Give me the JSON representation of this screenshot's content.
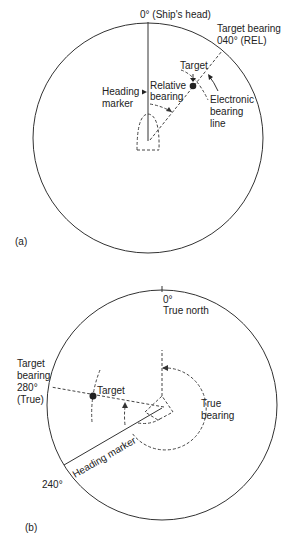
{
  "figure": {
    "colors": {
      "ink": "#333333",
      "background": "#ffffff"
    },
    "panel_a": {
      "label": "(a)",
      "mode": "relative bearing (ship's head up)",
      "labels": {
        "ships_head": "0° (Ship's head)",
        "target_bearing_line1": "Target bearing",
        "target_bearing_line2": "040° (REL)",
        "target": "Target",
        "relative_bearing_line1": "Relative",
        "relative_bearing_line2": "bearing",
        "heading_marker_line1": "Heading",
        "heading_marker_line2": "marker",
        "ebl_line1": "Electronic",
        "ebl_line2": "bearing",
        "ebl_line3": "line"
      },
      "bearing_deg": 40
    },
    "panel_b": {
      "label": "(b)",
      "mode": "true bearing (north up)",
      "labels": {
        "north_deg": "0°",
        "true_north": "True north",
        "target_bearing_line1": "Target",
        "target_bearing_line2": "bearing",
        "target_bearing_line3": "280°",
        "target_bearing_line4": "(True)",
        "target": "Target",
        "true_bearing_line1": "True",
        "true_bearing_line2": "bearing",
        "heading_marker": "Heading marker",
        "heading_deg": "240°"
      },
      "heading_deg": 240,
      "bearing_deg": 280
    }
  }
}
